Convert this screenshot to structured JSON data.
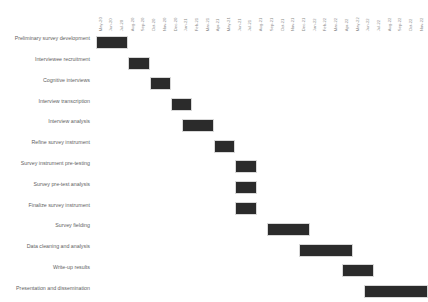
{
  "chart_data": {
    "type": "bar",
    "chart_kind": "gantt",
    "title": "",
    "xlabel": "",
    "ylabel": "",
    "grid": false,
    "legend": "none",
    "bar_color": "#2b2b2b",
    "background_color": "#ffffff",
    "label_color": "#5f5f5f",
    "tick_color": "#8a8a8a",
    "x_axis_position": "top",
    "x_tick_rotation": 90,
    "time_unit": "month",
    "x_range": [
      "May-20",
      "Nov-22"
    ],
    "tick_labels": [
      "May-20",
      "Jun-20",
      "Jul-20",
      "Aug-20",
      "Sep-20",
      "Oct-20",
      "Nov-20",
      "Dec-20",
      "Jan-21",
      "Feb-21",
      "Mar-21",
      "Apr-21",
      "May-21",
      "Jun-21",
      "Jul-21",
      "Aug-21",
      "Sep-21",
      "Oct-21",
      "Nov-21",
      "Dec-21",
      "Jan-22",
      "Feb-22",
      "Mar-22",
      "Apr-22",
      "May-22",
      "Jun-22",
      "Jul-22",
      "Aug-22",
      "Sep-22",
      "Oct-22",
      "Nov-22"
    ],
    "categories": [
      "Preliminary survey development",
      "Interviewee recruitment",
      "Cognitive interviews",
      "Interview transcription",
      "Interview analysis",
      "Refine survey instrument",
      "Survey instrument pre-testing",
      "Survey pre-test analysis",
      "Finalize survey instrument",
      "Survey fielding",
      "Data cleaning and analysis",
      "Write-up results",
      "Presentation and dissemination"
    ],
    "tasks": [
      {
        "name": "Preliminary survey development",
        "start": "May-20",
        "end": "Aug-20",
        "start_index": 0,
        "duration_months": 3
      },
      {
        "name": "Interviewee recruitment",
        "start": "Aug-20",
        "end": "Oct-20",
        "start_index": 3,
        "duration_months": 2
      },
      {
        "name": "Cognitive interviews",
        "start": "Oct-20",
        "end": "Dec-20",
        "start_index": 5,
        "duration_months": 2
      },
      {
        "name": "Interview transcription",
        "start": "Dec-20",
        "end": "Feb-21",
        "start_index": 7,
        "duration_months": 2
      },
      {
        "name": "Interview analysis",
        "start": "Jan-21",
        "end": "Apr-21",
        "start_index": 8,
        "duration_months": 3
      },
      {
        "name": "Refine survey instrument",
        "start": "Apr-21",
        "end": "Jun-21",
        "start_index": 11,
        "duration_months": 2
      },
      {
        "name": "Survey instrument pre-testing",
        "start": "Jun-21",
        "end": "Aug-21",
        "start_index": 13,
        "duration_months": 2
      },
      {
        "name": "Survey pre-test analysis",
        "start": "Jun-21",
        "end": "Aug-21",
        "start_index": 13,
        "duration_months": 2
      },
      {
        "name": "Finalize survey instrument",
        "start": "Jun-21",
        "end": "Aug-21",
        "start_index": 13,
        "duration_months": 2
      },
      {
        "name": "Survey fielding",
        "start": "Sep-21",
        "end": "Jan-22",
        "start_index": 16,
        "duration_months": 4
      },
      {
        "name": "Data cleaning and analysis",
        "start": "Dec-21",
        "end": "May-22",
        "start_index": 19,
        "duration_months": 5
      },
      {
        "name": "Write-up results",
        "start": "Apr-22",
        "end": "Jul-22",
        "start_index": 23,
        "duration_months": 3
      },
      {
        "name": "Presentation and dissemination",
        "start": "Jun-22",
        "end": "Nov-22",
        "start_index": 25,
        "duration_months": 6
      }
    ]
  }
}
